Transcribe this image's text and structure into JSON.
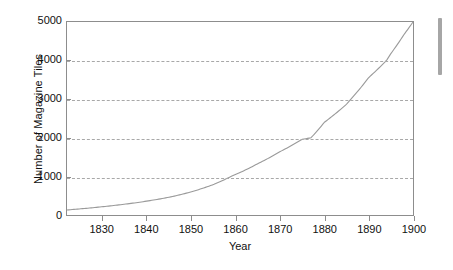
{
  "chart_data": {
    "type": "line",
    "title": "",
    "xlabel": "Year",
    "ylabel": "Number of Magazine Tiles",
    "xlim": [
      1822,
      1900
    ],
    "ylim": [
      0,
      5000
    ],
    "grid": "horizontal-dashed",
    "legend": "none",
    "xticks": [
      1830,
      1840,
      1850,
      1860,
      1870,
      1880,
      1890,
      1900
    ],
    "yticks": [
      0,
      1000,
      2000,
      3000,
      4000,
      5000
    ],
    "xtick_labels": [
      "1830",
      "1840",
      "1850",
      "1860",
      "1870",
      "1880",
      "1890",
      "1900"
    ],
    "ytick_labels": [
      "0",
      "1000",
      "2000",
      "3000",
      "4000",
      "5000"
    ],
    "series": [
      {
        "name": "Number of Magazine Titles",
        "color": "#9a9a9a",
        "x": [
          1822,
          1825,
          1830,
          1835,
          1840,
          1845,
          1850,
          1855,
          1859,
          1860,
          1865,
          1870,
          1875,
          1877,
          1880,
          1885,
          1886,
          1890,
          1894,
          1895,
          1898,
          1900
        ],
        "values": [
          130,
          160,
          215,
          280,
          360,
          460,
          600,
          790,
          1000,
          1050,
          1330,
          1640,
          1960,
          2000,
          2400,
          2870,
          3000,
          3560,
          4000,
          4180,
          4680,
          5000
        ]
      }
    ],
    "annotations": []
  },
  "figure": {
    "background_color": "#ffffff",
    "axis_color": "#8d8d8d",
    "grid_color": "#a8a8a8",
    "text_color": "#111111",
    "curve_color": "#9a9a9a"
  },
  "artifacts": {
    "right_bar_label": "scroll-indicator",
    "right_bar_color": "#a6a6a6"
  }
}
